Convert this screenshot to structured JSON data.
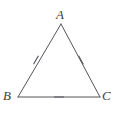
{
  "figure": {
    "name": "congruent-sides-triangle",
    "background_color": "#ffffff",
    "stroke_color": "#55555a",
    "label_color": "#3d3d3f",
    "stroke_width": 1,
    "vertices": [
      {
        "id": "A",
        "label": "A",
        "x": 61,
        "y": 24,
        "label_x": 56,
        "label_y": 8
      },
      {
        "id": "B",
        "label": "B",
        "x": 18,
        "y": 97,
        "label_x": 3,
        "label_y": 89
      },
      {
        "id": "C",
        "label": "C",
        "x": 100,
        "y": 97,
        "label_x": 102,
        "label_y": 89
      }
    ],
    "sides": [
      {
        "id": "AB",
        "from": "A",
        "to": "B",
        "tick_count": 1,
        "tick_x": 36,
        "tick_y": 60,
        "tick_angle_deg": 30.5
      },
      {
        "id": "AC",
        "from": "A",
        "to": "C",
        "tick_count": 1,
        "tick_x": 81,
        "tick_y": 60,
        "tick_angle_deg": -29.7
      },
      {
        "id": "BC",
        "from": "B",
        "to": "C",
        "tick_count": 1,
        "tick_x": 59,
        "tick_y": 97,
        "tick_angle_deg": 90
      }
    ],
    "tick_length": 9
  }
}
